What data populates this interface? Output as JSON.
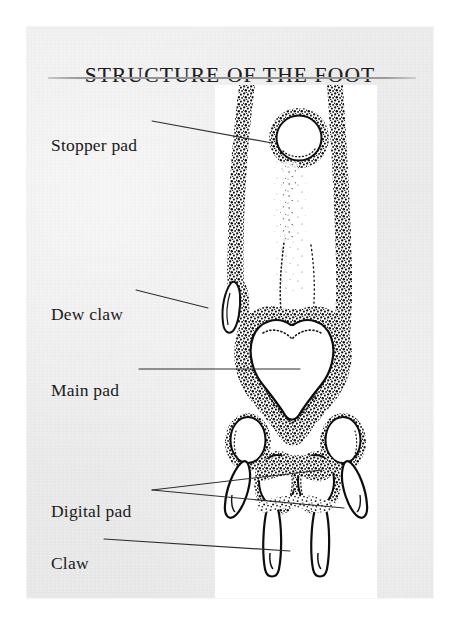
{
  "page": {
    "title": "STRUCTURE OF THE FOOT",
    "background_color": "#ffffff",
    "panel_color": "#e9e9e9",
    "rule_color": "#8f8f8f",
    "ink_color": "#1a1a1a"
  },
  "illustration": {
    "name": "dog-foot-underside-stipple-engraving",
    "description": "Underside view of a dog's foot rendered in stipple engraving: lower leg with a circular stopper pad, a dew claw on the left edge, a large heart-shaped main pad, four oval digital pads and their claws.",
    "plate_background": "#ffffff",
    "parts": [
      "stopper-pad",
      "dew-claw",
      "main-pad",
      "digital-pad",
      "claw"
    ]
  },
  "labels": [
    {
      "id": "stopper-pad",
      "text": "Stopper pad",
      "leader_count": 1
    },
    {
      "id": "dew-claw",
      "text": "Dew claw",
      "leader_count": 1
    },
    {
      "id": "main-pad",
      "text": "Main pad",
      "leader_count": 1
    },
    {
      "id": "digital-pad",
      "text": "Digital pad",
      "leader_count": 2
    },
    {
      "id": "claw",
      "text": "Claw",
      "leader_count": 1
    }
  ]
}
